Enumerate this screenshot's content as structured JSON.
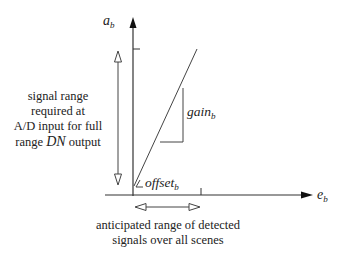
{
  "diagram": {
    "y_axis": {
      "symbol": "a",
      "subscript": "b"
    },
    "x_axis": {
      "symbol": "e",
      "subscript": "b"
    },
    "gain_label": {
      "symbol": "gain",
      "subscript": "b"
    },
    "offset_label": {
      "symbol": "offset",
      "subscript": "b"
    },
    "left_annotation": {
      "line1": "signal range",
      "line2": "required at",
      "line3": "A/D input for full",
      "line4_pre": "range ",
      "line4_italic": "DN",
      "line4_post": " output"
    },
    "bottom_annotation": {
      "line1": "anticipated range of detected",
      "line2": "signals over all scenes"
    },
    "colors": {
      "ink": "#222222",
      "line": "#444444",
      "background": "#ffffff"
    }
  }
}
